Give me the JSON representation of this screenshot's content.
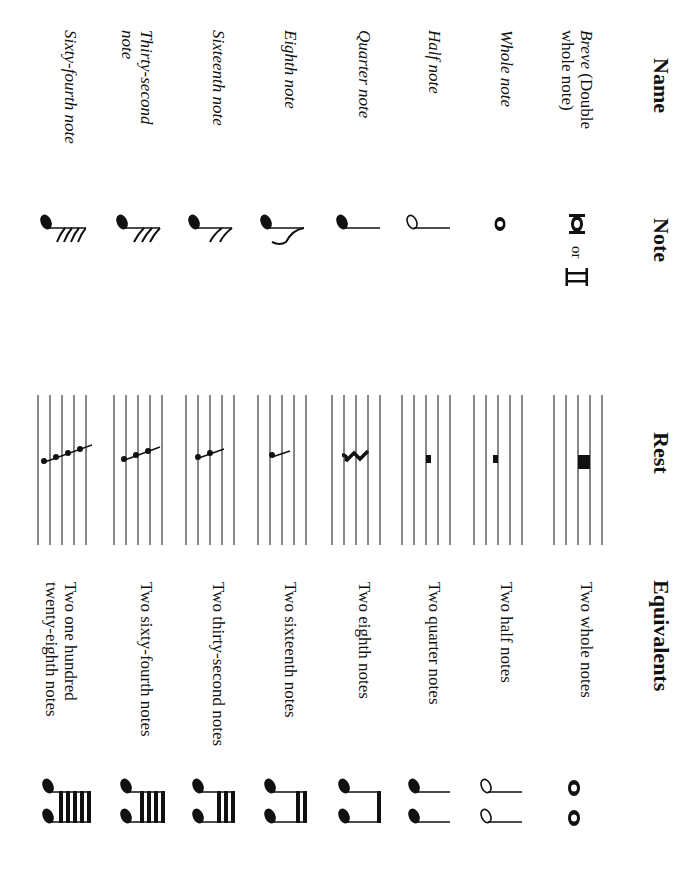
{
  "headers": {
    "name": "Name",
    "note": "Note",
    "rest": "Rest",
    "equivalents": "Equivalents"
  },
  "rows": [
    {
      "name": "Breve (Double whole note)",
      "name_italic": "Breve",
      "name_rest": " (Double whole note)",
      "note_glyph": "breve-note-icon",
      "note_or": "or",
      "rest_glyph": "breve-rest-icon",
      "equivalent": "Two whole notes",
      "equivalent_glyph": "two-whole-notes-icon"
    },
    {
      "name": "Whole note",
      "note_glyph": "whole-note-icon",
      "rest_glyph": "whole-rest-icon",
      "equivalent": "Two half notes",
      "equivalent_glyph": "two-half-notes-icon"
    },
    {
      "name": "Half note",
      "note_glyph": "half-note-icon",
      "rest_glyph": "half-rest-icon",
      "equivalent": "Two quarter notes",
      "equivalent_glyph": "two-quarter-notes-icon"
    },
    {
      "name": "Quarter note",
      "note_glyph": "quarter-note-icon",
      "rest_glyph": "quarter-rest-icon",
      "equivalent": "Two eighth notes",
      "equivalent_glyph": "two-eighth-notes-icon"
    },
    {
      "name": "Eighth note",
      "note_glyph": "eighth-note-icon",
      "rest_glyph": "eighth-rest-icon",
      "equivalent": "Two sixteenth notes",
      "equivalent_glyph": "two-sixteenth-notes-icon"
    },
    {
      "name": "Sixteenth note",
      "note_glyph": "sixteenth-note-icon",
      "rest_glyph": "sixteenth-rest-icon",
      "equivalent": "Two thirty-second notes",
      "equivalent_glyph": "two-thirty-second-notes-icon"
    },
    {
      "name": "Thirty-second note",
      "note_glyph": "thirty-second-note-icon",
      "rest_glyph": "thirty-second-rest-icon",
      "equivalent": "Two sixty-fourth notes",
      "equivalent_glyph": "two-sixty-fourth-notes-icon"
    },
    {
      "name": "Sixty-fourth note",
      "note_glyph": "sixty-fourth-note-icon",
      "rest_glyph": "sixty-fourth-rest-icon",
      "equivalent": "Two one hundred twenty-eighth notes",
      "equivalent_glyph": "two-128th-notes-icon"
    }
  ],
  "colors": {
    "ink": "#111111",
    "background": "#ffffff"
  },
  "orientation": "rotated 90deg clockwise"
}
